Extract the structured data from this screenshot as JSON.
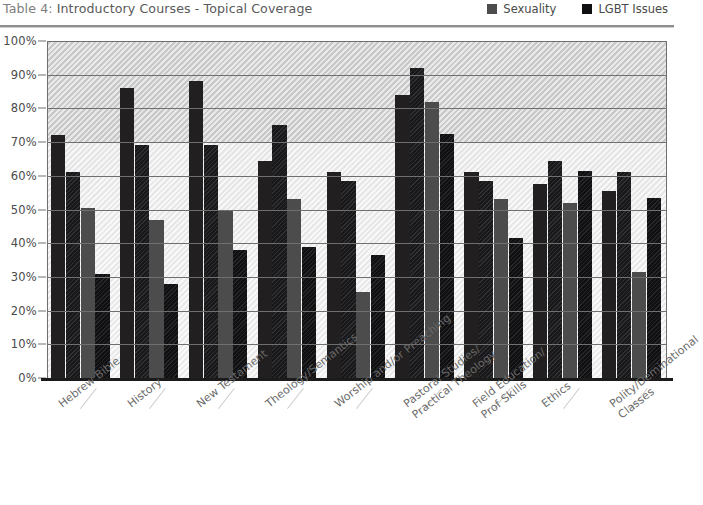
{
  "header": {
    "title_prefix": "Table 4:",
    "title_rest": " Introductory Courses - Topical Coverage",
    "full_title": "Table 4: Introductory Courses - Topical Coverage"
  },
  "legend": {
    "items": [
      {
        "label": "Sexuality",
        "color": "#4c4c4c",
        "icon": "legend-swatch-icon"
      },
      {
        "label": "LGBT Issues",
        "color": "#100f12",
        "icon": "legend-swatch-icon"
      }
    ]
  },
  "axis": {
    "y_ticks": [
      "0%",
      "10%",
      "20%",
      "30%",
      "40%",
      "50%",
      "60%",
      "70%",
      "80%",
      "90%",
      "100%"
    ]
  },
  "chart_data": {
    "type": "bar",
    "title": "Table 4: Introductory Courses - Topical Coverage",
    "xlabel": "",
    "ylabel": "",
    "ylim": [
      0,
      100
    ],
    "ytick_interval": 10,
    "grid": true,
    "legend_position": "top-right",
    "categories": [
      "Hebrew Bible",
      "History",
      "New Testament",
      "Theology/Semantics",
      "Worship and/or Preaching",
      "Pastoral Studies/\nPractical Theology",
      "Field Education/\nProf Skills",
      "Ethics",
      "Polity/Deminational\nClasses"
    ],
    "series": [
      {
        "name": "Series 1",
        "color": "#211f1f",
        "values": [
          72,
          86,
          88,
          64.5,
          61,
          84,
          61,
          57.5,
          55.5
        ]
      },
      {
        "name": "Series 2",
        "color": "#18171a",
        "values": [
          61,
          69,
          69,
          75,
          58.5,
          92,
          58.5,
          64.5,
          61
        ]
      },
      {
        "name": "Sexuality",
        "color": "#4c4c4c",
        "values": [
          50.5,
          47,
          50,
          53,
          25.5,
          82,
          53,
          52,
          31.5
        ]
      },
      {
        "name": "LGBT Issues",
        "color": "#100f12",
        "values": [
          31,
          28,
          38,
          39,
          36.5,
          72.5,
          41.5,
          61.5,
          53.5
        ]
      }
    ]
  }
}
